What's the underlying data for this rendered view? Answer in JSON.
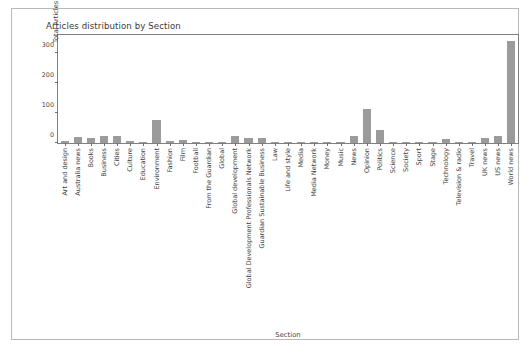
{
  "chart_data": {
    "type": "bar",
    "title": "Articles distribution by Section",
    "xlabel": "Section",
    "ylabel": "Total Articles Count",
    "ylim": [
      0,
      360
    ],
    "yticks": [
      0,
      100,
      200,
      300
    ],
    "grid": false,
    "legend": null,
    "bar_color": "#9b9b9b",
    "categories": [
      "Art and design",
      "Australia news",
      "Books",
      "Business",
      "Cities",
      "Culture",
      "Education",
      "Environment",
      "Fashion",
      "Film",
      "Football",
      "From the Guardian",
      "Global",
      "Global development",
      "Global Development Professionals Network",
      "Guardian Sustainable Business",
      "Law",
      "Life and style",
      "Media",
      "Media Network",
      "Money",
      "Music",
      "News",
      "Opinion",
      "Politics",
      "Science",
      "Society",
      "Sport",
      "Stage",
      "Technology",
      "Television & radio",
      "Travel",
      "UK news",
      "US news",
      "World news"
    ],
    "values": [
      6,
      20,
      18,
      24,
      23,
      6,
      3,
      78,
      8,
      9,
      2,
      2,
      4,
      24,
      17,
      16,
      3,
      3,
      2,
      2,
      3,
      3,
      22,
      115,
      42,
      5,
      3,
      2,
      2,
      12,
      3,
      2,
      18,
      22,
      340
    ]
  },
  "axis": {
    "ytick_labels": [
      "0",
      "100",
      "200",
      "300"
    ]
  }
}
